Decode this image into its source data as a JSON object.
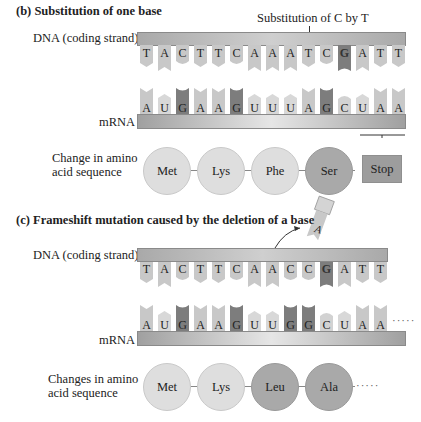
{
  "panel_b": {
    "title": "(b) Substitution of one base",
    "annotation": "Substitution of C by T",
    "dna_label": "DNA (coding strand)",
    "dna_bases": [
      "T",
      "A",
      "C",
      "T",
      "T",
      "C",
      "A",
      "A",
      "A",
      "T",
      "C",
      "G",
      "A",
      "T",
      "T"
    ],
    "mrna_label": "mRNA",
    "mrna_bases": [
      "A",
      "U",
      "G",
      "A",
      "A",
      "G",
      "U",
      "U",
      "U",
      "A",
      "G",
      "C",
      "U",
      "A",
      "A"
    ],
    "aa_label_line1": "Change in amino",
    "aa_label_line2": "acid sequence",
    "amino_acids": [
      "Met",
      "Lys",
      "Phe",
      "Ser"
    ],
    "stop_label": "Stop"
  },
  "panel_c": {
    "title": "(c) Frameshift mutation caused by the deletion of a base",
    "deleted_base": "A",
    "dna_label": "DNA (coding strand)",
    "dna_bases": [
      "T",
      "A",
      "C",
      "T",
      "T",
      "C",
      "A",
      "A",
      "C",
      "C",
      "G",
      "A",
      "T",
      "T"
    ],
    "mrna_label": "mRNA",
    "mrna_bases": [
      "A",
      "U",
      "G",
      "A",
      "A",
      "G",
      "U",
      "U",
      "G",
      "G",
      "C",
      "U",
      "A",
      "A"
    ],
    "mrna_continuation": "·····",
    "aa_label_line1": "Changes in amino",
    "aa_label_line2": "acid sequence",
    "amino_acids": [
      "Met",
      "Lys",
      "Leu",
      "Ala"
    ],
    "aa_continuation": "·····"
  },
  "colors": {
    "light_tab": "#c8c8c8",
    "dark_tab": "#7d7d7d",
    "light_circle": "#dedede",
    "dark_circle": "#a9a9a9",
    "stop_box": "#9d9d9d"
  }
}
